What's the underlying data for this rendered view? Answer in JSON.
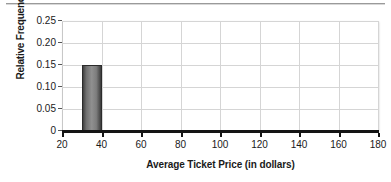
{
  "chart_data": {
    "type": "bar",
    "title": "",
    "subtitle": "",
    "xlabel": "Average Ticket Price (in dollars)",
    "ylabel": "Relative Frequency",
    "xlim": [
      20,
      180
    ],
    "ylim": [
      0,
      0.25
    ],
    "grid": true,
    "legend": false,
    "legend_position": "none",
    "bin_width": 10,
    "x_ticks": [
      20,
      40,
      60,
      80,
      100,
      120,
      140,
      160,
      180
    ],
    "x_tick_labels": [
      "20",
      "40",
      "60",
      "80",
      "100",
      "120",
      "140",
      "160",
      "180"
    ],
    "y_ticks": [
      0,
      0.05,
      0.1,
      0.15,
      0.2,
      0.25
    ],
    "y_tick_labels": [
      "0",
      "0.05",
      "0.10",
      "0.15",
      "0.20",
      "0.25"
    ],
    "bars": [
      {
        "bin_start": 30,
        "bin_end": 40,
        "value": 0.15,
        "label": "30-40"
      }
    ],
    "categories": [
      "30-40"
    ],
    "values": [
      0.15
    ],
    "bar_color": "#8a8a8a",
    "bar_edge_color": "#2b2b2b",
    "grid_color": "#d5d5d5",
    "axis_color": "#141414",
    "background_color": "#ffffff"
  }
}
